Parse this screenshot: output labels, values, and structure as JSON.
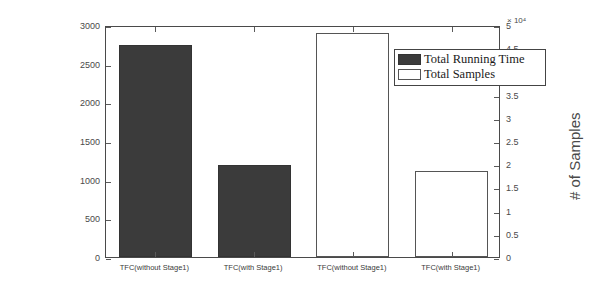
{
  "chart_data": {
    "type": "bar",
    "title": "",
    "categories": [
      "TFC(without Stage1)",
      "TFC(with Stage1)",
      "TFC(without Stage1)",
      "TFC(with Stage1)"
    ],
    "series": [
      {
        "name": "Total Running Time",
        "axis": "left",
        "color": "#3b3b3b",
        "style": "filled",
        "values": [
          2740,
          1190,
          null,
          null
        ]
      },
      {
        "name": "Total Samples",
        "axis": "right",
        "color": "#ffffff",
        "style": "hollow",
        "values": [
          null,
          null,
          48300,
          18500
        ]
      }
    ],
    "left_axis": {
      "label": "Time Cost(s)",
      "ylim": [
        0,
        3000
      ],
      "ticks": [
        0,
        500,
        1000,
        1500,
        2000,
        2500,
        3000
      ],
      "tick_labels": [
        "0",
        "500",
        "1000",
        "1500",
        "2000",
        "2500",
        "3000"
      ]
    },
    "right_axis": {
      "label": "# of Samples",
      "ylim": [
        0,
        50000
      ],
      "exponent_label": "× 10⁴",
      "ticks": [
        0,
        5000,
        10000,
        15000,
        20000,
        25000,
        30000,
        35000,
        40000,
        45000,
        50000
      ],
      "tick_labels": [
        "0",
        "0.5",
        "1",
        "1.5",
        "2",
        "2.5",
        "3",
        "3.5",
        "4",
        "4.5",
        "5"
      ]
    },
    "xlabel": "",
    "grid": false,
    "legend": {
      "position": "top-right",
      "entries": [
        {
          "label": "Total Running Time",
          "style": "filled"
        },
        {
          "label": "Total Samples",
          "style": "hollow"
        }
      ]
    }
  }
}
